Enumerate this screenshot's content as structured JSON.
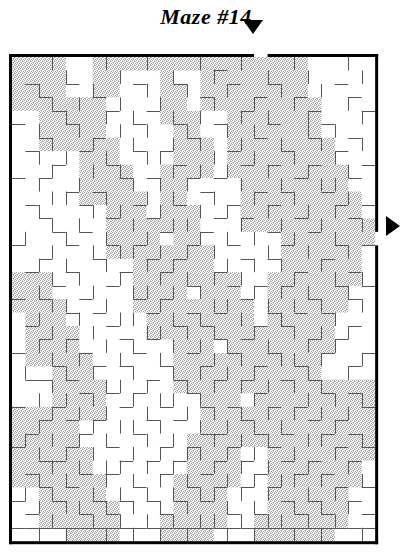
{
  "title": "Maze #14",
  "colors": {
    "border": "#000000",
    "wall": "#555555",
    "path_fill": "#cfcfcf",
    "background": "#ffffff",
    "arrow": "#000000"
  },
  "maze": {
    "label": "maze-grid",
    "cols": 27,
    "rows": 36,
    "cell": 13.45,
    "origin_x": 12,
    "origin_y": 57,
    "border_width": 3,
    "wall_width": 1,
    "entrance": {
      "side": "top",
      "col": 18,
      "arrow_x": 253,
      "arrow_y": 34
    },
    "exit": {
      "side": "right",
      "row": 13,
      "arrow_x": 386,
      "arrow_y": 226
    },
    "solution_shaded": true,
    "hwalls": [
      "111111111111111111011111111",
      "000000000000000100000000000",
      "010010000100100010010000100",
      "001000100000001000100100010",
      "000100010010000001000010001",
      "100010000100100100010001000",
      "001000100000010000100010010",
      "010001000101000010001000100",
      "000100010000100001010010001",
      "101000001010010100000100010",
      "000010100000001000101001000",
      "010001000100100010010000101",
      "001000010010000101000100010",
      "000101000001001000010010000",
      "100010010100010010001000101",
      "001000100010100001010001000",
      "010010001001000100000100010",
      "000100010000010010101000101",
      "101001000101000001000010010",
      "000010100010010100010101000",
      "010000010000101000101000010",
      "001010001010000101000010100",
      "100001000100010010010001001",
      "000100101001001000100100010",
      "011010000010100101001010000",
      "000001010100010000100001010",
      "100100001001001010010100001",
      "001010100010100001000010100",
      "010001000100001100101001010",
      "100010010001010010010000101",
      "001100001010100101001010010",
      "010001010001001000100101000",
      "001010000100010101010000101",
      "100100101010101000001010010",
      "010001010001000010100101001",
      "111111111111111111111111111"
    ],
    "vwalls": [
      "1001000100100010010001000101",
      "1000100010001001000100100011",
      "1010001000100100100010010001",
      "1001010010010001001001000101",
      "1000100101001010010100100011",
      "1010010010100100101000101001",
      "1001001001001010010010010011",
      "1010100100110001001001001001",
      "1001001010001010100100100101",
      "1010010001010100010010011001",
      "1001100100101001001001000101",
      "1010001010010010100100101001",
      "1001010001001100010010010011",
      "1100100100100010101001001001",
      "1001001011010101000100100101",
      "1010100100101000101010010001",
      "1001010010010101010001001011",
      "1010001001101010001010100101",
      "1001100100010001100101010011",
      "1010010011001010010010001001",
      "1001001000110101001001010101",
      "1010100101001010100100101001",
      "1001010010010001010011010011",
      "1100101001001010101000100101",
      "1001000110100101010101010001",
      "1010101001011010001000101011",
      "1001010100100101010101010101",
      "1010001011010010101010001001",
      "1101010100101001010100110011",
      "1010101001010110101001001001",
      "1001010110101001010100100101",
      "1010100101010100101011010011",
      "1101001010101011010100101001",
      "1010110101010100101001010101",
      "1001001010101011010110101001",
      "1010100101010100101001010011"
    ],
    "shaded_cells": [
      [
        0,
        0,
        3
      ],
      [
        0,
        6,
        21
      ],
      [
        1,
        0,
        3
      ],
      [
        1,
        6,
        7
      ],
      [
        1,
        11,
        11
      ],
      [
        1,
        14,
        21
      ],
      [
        2,
        0,
        3
      ],
      [
        2,
        6,
        7
      ],
      [
        2,
        11,
        12
      ],
      [
        2,
        14,
        21
      ],
      [
        3,
        0,
        6
      ],
      [
        3,
        11,
        12
      ],
      [
        3,
        14,
        22
      ],
      [
        4,
        2,
        6
      ],
      [
        4,
        11,
        13
      ],
      [
        4,
        16,
        22
      ],
      [
        5,
        2,
        6
      ],
      [
        5,
        12,
        13
      ],
      [
        5,
        16,
        22
      ],
      [
        6,
        2,
        7
      ],
      [
        6,
        12,
        14
      ],
      [
        6,
        16,
        23
      ],
      [
        7,
        5,
        7
      ],
      [
        7,
        12,
        14
      ],
      [
        7,
        16,
        23
      ],
      [
        8,
        5,
        8
      ],
      [
        8,
        11,
        14
      ],
      [
        8,
        16,
        24
      ],
      [
        9,
        5,
        8
      ],
      [
        9,
        11,
        12
      ],
      [
        9,
        17,
        24
      ],
      [
        10,
        5,
        9
      ],
      [
        10,
        11,
        12
      ],
      [
        10,
        17,
        25
      ],
      [
        11,
        7,
        9
      ],
      [
        11,
        11,
        13
      ],
      [
        11,
        17,
        25
      ],
      [
        12,
        7,
        10
      ],
      [
        12,
        11,
        13
      ],
      [
        12,
        17,
        26
      ],
      [
        13,
        7,
        10
      ],
      [
        13,
        12,
        13
      ],
      [
        13,
        20,
        26
      ],
      [
        14,
        7,
        11
      ],
      [
        14,
        12,
        14
      ],
      [
        14,
        20,
        25
      ],
      [
        15,
        9,
        11
      ],
      [
        15,
        12,
        14
      ],
      [
        15,
        20,
        25
      ],
      [
        16,
        0,
        2
      ],
      [
        16,
        9,
        12
      ],
      [
        16,
        12,
        16
      ],
      [
        16,
        19,
        25
      ],
      [
        17,
        0,
        2
      ],
      [
        17,
        9,
        12
      ],
      [
        17,
        14,
        16
      ],
      [
        17,
        19,
        24
      ],
      [
        18,
        0,
        3
      ],
      [
        18,
        9,
        13
      ],
      [
        18,
        14,
        17
      ],
      [
        18,
        19,
        24
      ],
      [
        19,
        1,
        3
      ],
      [
        19,
        10,
        13
      ],
      [
        19,
        14,
        17
      ],
      [
        19,
        19,
        23
      ],
      [
        20,
        1,
        4
      ],
      [
        20,
        10,
        14
      ],
      [
        20,
        14,
        18
      ],
      [
        20,
        19,
        23
      ],
      [
        21,
        1,
        4
      ],
      [
        21,
        12,
        14
      ],
      [
        21,
        16,
        18
      ],
      [
        21,
        18,
        23
      ],
      [
        22,
        1,
        5
      ],
      [
        22,
        12,
        15
      ],
      [
        22,
        16,
        19
      ],
      [
        22,
        18,
        22
      ],
      [
        23,
        3,
        5
      ],
      [
        23,
        12,
        15
      ],
      [
        23,
        16,
        19
      ],
      [
        23,
        18,
        22
      ],
      [
        24,
        3,
        6
      ],
      [
        24,
        12,
        16
      ],
      [
        24,
        16,
        20
      ],
      [
        24,
        18,
        26
      ],
      [
        25,
        3,
        6
      ],
      [
        25,
        14,
        16
      ],
      [
        25,
        18,
        20
      ],
      [
        25,
        21,
        26
      ],
      [
        26,
        0,
        6
      ],
      [
        26,
        14,
        17
      ],
      [
        26,
        18,
        26
      ],
      [
        27,
        0,
        4
      ],
      [
        27,
        14,
        17
      ],
      [
        27,
        18,
        26
      ],
      [
        28,
        0,
        4
      ],
      [
        28,
        13,
        17
      ],
      [
        28,
        18,
        26
      ],
      [
        29,
        0,
        5
      ],
      [
        29,
        13,
        16
      ],
      [
        29,
        19,
        26
      ],
      [
        30,
        0,
        5
      ],
      [
        30,
        13,
        16
      ],
      [
        30,
        19,
        25
      ],
      [
        31,
        0,
        6
      ],
      [
        31,
        12,
        16
      ],
      [
        31,
        19,
        25
      ],
      [
        32,
        2,
        6
      ],
      [
        32,
        12,
        15
      ],
      [
        32,
        19,
        24
      ],
      [
        33,
        2,
        7
      ],
      [
        33,
        12,
        15
      ],
      [
        33,
        19,
        24
      ],
      [
        34,
        2,
        7
      ],
      [
        34,
        11,
        15
      ],
      [
        34,
        18,
        24
      ],
      [
        35,
        4,
        7
      ],
      [
        35,
        11,
        14
      ],
      [
        35,
        18,
        23
      ]
    ]
  },
  "arrows": {
    "entry": {
      "name": "entrance-arrow",
      "direction": "down"
    },
    "exit": {
      "name": "exit-arrow",
      "direction": "right"
    }
  }
}
